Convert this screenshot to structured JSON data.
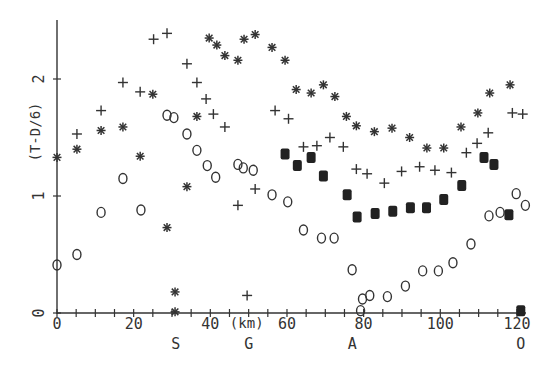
{
  "chart_data": {
    "type": "scatter",
    "title": "",
    "xlabel": "(km)",
    "ylabel": "(T-D/6)",
    "xlim": [
      0,
      125
    ],
    "ylim": [
      0,
      2.5
    ],
    "grid": false,
    "legend": null,
    "x_ticks": [
      0,
      20,
      40,
      60,
      80,
      100,
      120
    ],
    "x_tick_labels": [
      "0",
      "20",
      "40",
      "60",
      "80",
      "100",
      "120"
    ],
    "x_minor_tick_step": 5,
    "y_ticks": [
      0,
      1,
      2
    ],
    "y_tick_labels": [
      "0",
      "1",
      "2"
    ],
    "site_markers": [
      {
        "label": "S",
        "x": 31
      },
      {
        "label": "G",
        "x": 50
      },
      {
        "label": "A",
        "x": 77
      },
      {
        "label": "O",
        "x": 121
      }
    ],
    "series": [
      {
        "name": "asterisk",
        "marker": "asterisk",
        "points": [
          [
            0,
            1.33
          ],
          [
            5.2,
            1.4
          ],
          [
            11.5,
            1.56
          ],
          [
            17.2,
            1.59
          ],
          [
            21.7,
            1.34
          ],
          [
            25.0,
            1.87
          ],
          [
            28.7,
            0.73
          ],
          [
            30.8,
            0.18
          ],
          [
            30.8,
            0.01
          ],
          [
            33.9,
            1.08
          ],
          [
            36.5,
            1.68
          ],
          [
            39.7,
            2.35
          ],
          [
            41.7,
            2.29
          ],
          [
            43.8,
            2.2
          ],
          [
            47.2,
            2.16
          ],
          [
            48.8,
            2.34
          ],
          [
            51.7,
            2.38
          ],
          [
            56.1,
            2.27
          ],
          [
            59.5,
            2.16
          ],
          [
            62.4,
            1.91
          ],
          [
            66.3,
            1.88
          ],
          [
            69.5,
            1.95
          ],
          [
            72.5,
            1.85
          ],
          [
            75.5,
            1.68
          ],
          [
            78.1,
            1.6
          ],
          [
            82.8,
            1.55
          ],
          [
            87.4,
            1.58
          ],
          [
            92.0,
            1.5
          ],
          [
            96.5,
            1.41
          ],
          [
            100.9,
            1.41
          ],
          [
            105.4,
            1.59
          ],
          [
            109.8,
            1.71
          ],
          [
            112.9,
            1.88
          ],
          [
            118.2,
            1.95
          ]
        ]
      },
      {
        "name": "plus",
        "marker": "plus",
        "points": [
          [
            5.2,
            1.53
          ],
          [
            11.5,
            1.73
          ],
          [
            17.2,
            1.97
          ],
          [
            21.7,
            1.89
          ],
          [
            25.2,
            2.34
          ],
          [
            28.7,
            2.39
          ],
          [
            33.9,
            2.13
          ],
          [
            36.5,
            1.97
          ],
          [
            38.9,
            1.83
          ],
          [
            40.8,
            1.7
          ],
          [
            43.8,
            1.59
          ],
          [
            47.2,
            0.92
          ],
          [
            49.6,
            0.15
          ],
          [
            51.7,
            1.06
          ],
          [
            56.9,
            1.73
          ],
          [
            60.4,
            1.66
          ],
          [
            64.3,
            1.42
          ],
          [
            67.8,
            1.43
          ],
          [
            71.2,
            1.5
          ],
          [
            74.7,
            1.42
          ],
          [
            78.1,
            1.23
          ],
          [
            80.9,
            1.19
          ],
          [
            85.4,
            1.11
          ],
          [
            89.9,
            1.21
          ],
          [
            94.6,
            1.25
          ],
          [
            98.6,
            1.22
          ],
          [
            102.9,
            1.2
          ],
          [
            106.8,
            1.37
          ],
          [
            109.6,
            1.45
          ],
          [
            112.5,
            1.54
          ],
          [
            118.8,
            1.71
          ],
          [
            121.5,
            1.7
          ]
        ]
      },
      {
        "name": "open-circle",
        "marker": "circle",
        "points": [
          [
            0,
            0.41
          ],
          [
            5.2,
            0.5
          ],
          [
            11.5,
            0.86
          ],
          [
            17.2,
            1.15
          ],
          [
            21.9,
            0.88
          ],
          [
            28.7,
            1.69
          ],
          [
            30.5,
            1.67
          ],
          [
            33.9,
            1.53
          ],
          [
            36.5,
            1.39
          ],
          [
            39.2,
            1.26
          ],
          [
            41.4,
            1.16
          ],
          [
            47.2,
            1.27
          ],
          [
            48.6,
            1.24
          ],
          [
            51.2,
            1.22
          ],
          [
            56.1,
            1.01
          ],
          [
            60.2,
            0.95
          ],
          [
            64.3,
            0.71
          ],
          [
            69.0,
            0.64
          ],
          [
            72.3,
            0.64
          ],
          [
            77.0,
            0.37
          ],
          [
            79.2,
            0.02
          ],
          [
            79.7,
            0.12
          ],
          [
            81.6,
            0.15
          ],
          [
            86.2,
            0.14
          ],
          [
            90.9,
            0.23
          ],
          [
            95.4,
            0.36
          ],
          [
            99.5,
            0.36
          ],
          [
            103.3,
            0.43
          ],
          [
            108.0,
            0.59
          ],
          [
            112.7,
            0.83
          ],
          [
            115.6,
            0.86
          ],
          [
            119.8,
            1.02
          ],
          [
            122.2,
            0.92
          ],
          [
            121.0,
            -0.43
          ]
        ]
      },
      {
        "name": "filled-square",
        "marker": "square",
        "points": [
          [
            59.5,
            1.36
          ],
          [
            62.7,
            1.26
          ],
          [
            66.3,
            1.33
          ],
          [
            69.5,
            1.17
          ],
          [
            75.7,
            1.01
          ],
          [
            78.3,
            0.82
          ],
          [
            83.0,
            0.85
          ],
          [
            87.6,
            0.87
          ],
          [
            92.2,
            0.9
          ],
          [
            96.4,
            0.9
          ],
          [
            100.9,
            0.97
          ],
          [
            105.6,
            1.09
          ],
          [
            111.4,
            1.33
          ],
          [
            114.0,
            1.27
          ],
          [
            117.9,
            0.84
          ],
          [
            121.0,
            0.02
          ]
        ]
      }
    ]
  }
}
